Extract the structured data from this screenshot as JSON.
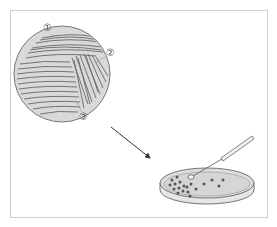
{
  "diagram": {
    "labels": [
      {
        "id": "1",
        "text": "①",
        "x": 48,
        "y": 30
      },
      {
        "id": "2",
        "text": "②",
        "x": 111,
        "y": 55
      },
      {
        "id": "3",
        "text": "③",
        "x": 84,
        "y": 119
      }
    ],
    "magnified_plate": {
      "cx": 62,
      "cy": 74,
      "r": 48,
      "fill": "#d8d8d8",
      "stroke": "#777777"
    },
    "arrow": {
      "from": [
        111,
        127
      ],
      "to": [
        151,
        159
      ],
      "color": "#333333"
    },
    "petri_dish": {
      "cx": 207,
      "cy": 183,
      "rx": 47,
      "ry": 16,
      "fill": "#e0e0e0",
      "stroke": "#666666"
    },
    "colony_color": "#555555",
    "frame_color": "#cfcfcf"
  }
}
